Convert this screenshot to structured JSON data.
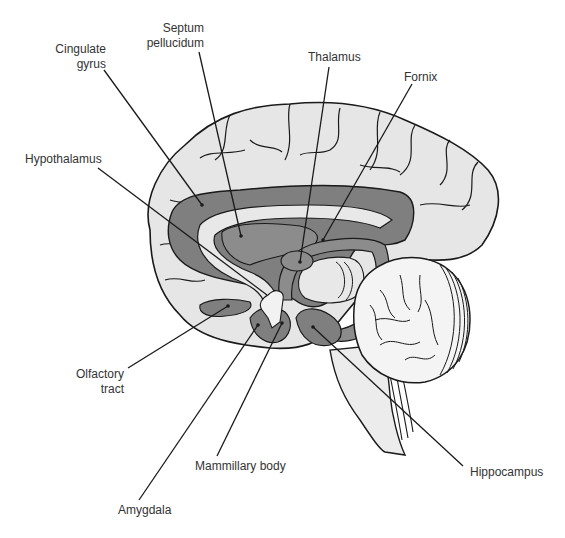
{
  "diagram": {
    "colors": {
      "cortex_fill": "#e6e6e6",
      "limbic_dark": "#7f7f7f",
      "limbic_mid": "#a8a8a8",
      "outline": "#1a1a1a",
      "label_text": "#333333"
    },
    "labels": [
      {
        "id": "cingulate-gyrus",
        "text": "Cingulate\ngyrus",
        "x": 54,
        "y": 42,
        "align": "right",
        "w": 52
      },
      {
        "id": "septum-pellucidum",
        "text": "Septum\npellucidum",
        "x": 146,
        "y": 21,
        "align": "right",
        "w": 58
      },
      {
        "id": "thalamus",
        "text": "Thalamus",
        "x": 308,
        "y": 50,
        "align": "left",
        "w": 60
      },
      {
        "id": "fornix",
        "text": "Fornix",
        "x": 404,
        "y": 70,
        "align": "left",
        "w": 45
      },
      {
        "id": "hypothalamus",
        "text": "Hypothalamus",
        "x": 25,
        "y": 152,
        "align": "left",
        "w": 90
      },
      {
        "id": "olfactory-tract",
        "text": "Olfactory\ntract",
        "x": 74,
        "y": 367,
        "align": "right",
        "w": 50
      },
      {
        "id": "mammillary-body",
        "text": "Mammillary body",
        "x": 195,
        "y": 459,
        "align": "left",
        "w": 100
      },
      {
        "id": "amygdala",
        "text": "Amygdala",
        "x": 118,
        "y": 503,
        "align": "left",
        "w": 60
      },
      {
        "id": "hippocampus",
        "text": "Hippocampus",
        "x": 470,
        "y": 465,
        "align": "left",
        "w": 90
      }
    ]
  }
}
